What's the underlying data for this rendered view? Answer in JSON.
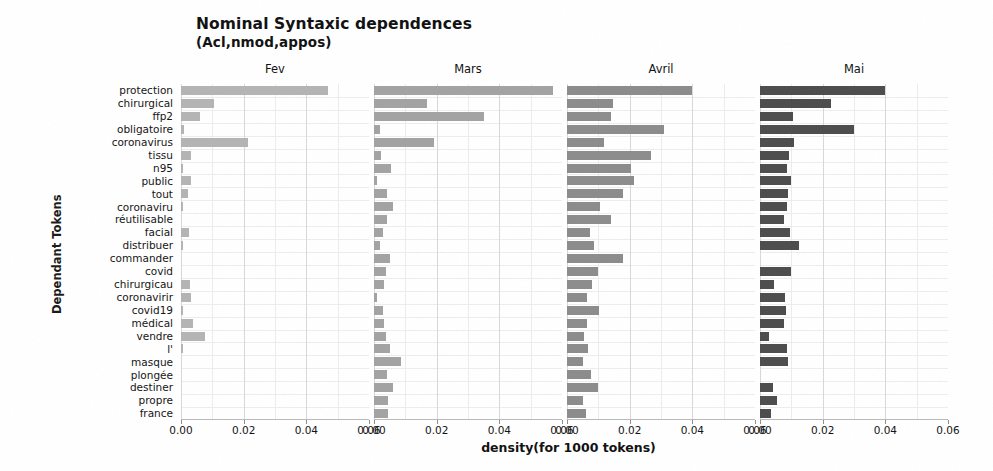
{
  "chart_data": {
    "type": "bar",
    "title": "Nominal Syntaxic dependences",
    "subtitle": "(Acl,nmod,appos)",
    "xlabel": "density(for 1000 tokens)",
    "ylabel": "Dependant Tokens",
    "orientation": "horizontal",
    "facet_by": "month",
    "xlim": [
      0,
      0.06
    ],
    "xticks": [
      0.0,
      0.02,
      0.04,
      0.06
    ],
    "xtick_labels": [
      "0.00",
      "0.02",
      "0.04",
      "0.06"
    ],
    "grid": true,
    "legend": "none",
    "categories": [
      "protection",
      "chirurgical",
      "ffp2",
      "obligatoire",
      "coronavirus",
      "tissu",
      "n95",
      "public",
      "tout",
      "coronaviru",
      "réutilisable",
      "facial",
      "distribuer",
      "commander",
      "covid",
      "chirurgicau",
      "coronavirir",
      "covid19",
      "médical",
      "vendre",
      "l'",
      "masque",
      "plongée",
      "destiner",
      "propre",
      "france"
    ],
    "series": [
      {
        "name": "Fev",
        "color": "#b4b4b4",
        "values": [
          0.047,
          0.0105,
          0.0062,
          0.0008,
          0.0215,
          0.0032,
          0.0005,
          0.0032,
          0.0022,
          0.0005,
          0.0,
          0.0026,
          0.0005,
          0.0,
          0.0,
          0.003,
          0.0033,
          0.0005,
          0.0038,
          0.0075,
          0.0005,
          0.0,
          0.0,
          0.0,
          0.0,
          0.0
        ]
      },
      {
        "name": "Mars",
        "color": "#a3a3a3",
        "values": [
          0.057,
          0.017,
          0.035,
          0.002,
          0.019,
          0.0022,
          0.0055,
          0.0008,
          0.004,
          0.006,
          0.0042,
          0.0028,
          0.0018,
          0.005,
          0.0038,
          0.0032,
          0.001,
          0.003,
          0.0032,
          0.0038,
          0.005,
          0.0085,
          0.004,
          0.006,
          0.0045,
          0.0045
        ]
      },
      {
        "name": "Avril",
        "color": "#8c8c8c",
        "values": [
          0.04,
          0.0148,
          0.014,
          0.031,
          0.0118,
          0.0268,
          0.0205,
          0.0215,
          0.0178,
          0.0105,
          0.014,
          0.0072,
          0.0085,
          0.018,
          0.0098,
          0.008,
          0.0063,
          0.0103,
          0.0063,
          0.0055,
          0.0068,
          0.0052,
          0.0075,
          0.0098,
          0.005,
          0.006
        ]
      },
      {
        "name": "Mai",
        "color": "#4d4d4d",
        "values": [
          0.04,
          0.0228,
          0.0105,
          0.03,
          0.0108,
          0.0092,
          0.0085,
          0.0098,
          0.0088,
          0.0085,
          0.0075,
          0.0095,
          0.0125,
          0.0,
          0.0098,
          0.0045,
          0.008,
          0.0082,
          0.0075,
          0.0028,
          0.0085,
          0.009,
          0.0,
          0.004,
          0.0055,
          0.0035
        ]
      }
    ]
  },
  "panels": [
    {
      "label": "Fev"
    },
    {
      "label": "Mars"
    },
    {
      "label": "Avril"
    },
    {
      "label": "Mai"
    }
  ]
}
